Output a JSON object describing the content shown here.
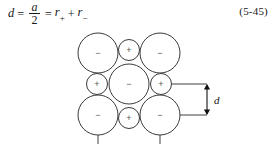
{
  "equation": {
    "lhs_variable": "d",
    "equals_1": "=",
    "fraction_numerator": "a",
    "fraction_denominator": "2",
    "equals_2": "=",
    "term_1_base": "r",
    "term_1_sub": "+",
    "plus_operator": "+",
    "term_2_base": "r",
    "term_2_sub": "−",
    "number": "(5-45)",
    "plain_text": "d = a/2 = r+ + r−"
  },
  "diagram": {
    "anion_sign": "−",
    "cation_sign": "+",
    "dimension_label": "d",
    "colors": {
      "circle_stroke": "#3a3a3a",
      "circle_fill": "#ffffff",
      "sign_color": "#555555",
      "dimension_color": "#111111",
      "background": "#ffffff"
    },
    "anion_radius": 20,
    "cation_radius": 10.5,
    "ions": [
      {
        "id": "anion-top-left",
        "type": "anion",
        "sign": "−",
        "cx": 98,
        "cy": 53
      },
      {
        "id": "cation-top-center",
        "type": "cation",
        "sign": "+",
        "cx": 129,
        "cy": 50
      },
      {
        "id": "anion-top-right",
        "type": "anion",
        "sign": "−",
        "cx": 160,
        "cy": 53
      },
      {
        "id": "cation-mid-left",
        "type": "cation",
        "sign": "+",
        "cx": 97,
        "cy": 84
      },
      {
        "id": "anion-mid-center",
        "type": "anion",
        "sign": "−",
        "cx": 129,
        "cy": 84
      },
      {
        "id": "cation-mid-right",
        "type": "cation",
        "sign": "+",
        "cx": 161,
        "cy": 84
      },
      {
        "id": "anion-bottom-left",
        "type": "anion",
        "sign": "−",
        "cx": 98,
        "cy": 115
      },
      {
        "id": "cation-bottom-center",
        "type": "cation",
        "sign": "+",
        "cx": 129,
        "cy": 118
      },
      {
        "id": "anion-bottom-right",
        "type": "anion",
        "sign": "−",
        "cx": 160,
        "cy": 115
      }
    ],
    "tick_marks": [
      {
        "id": "tick-left",
        "x": 98,
        "y1": 135,
        "y2": 144
      },
      {
        "id": "tick-right",
        "x": 160,
        "y1": 135,
        "y2": 144
      }
    ],
    "dimension": {
      "leader_top_y": 84,
      "leader_bottom_y": 115,
      "leader_x_start": 170,
      "leader_x_end": 207,
      "arrow_x": 207,
      "label_x": 214,
      "label_y": 100
    }
  }
}
